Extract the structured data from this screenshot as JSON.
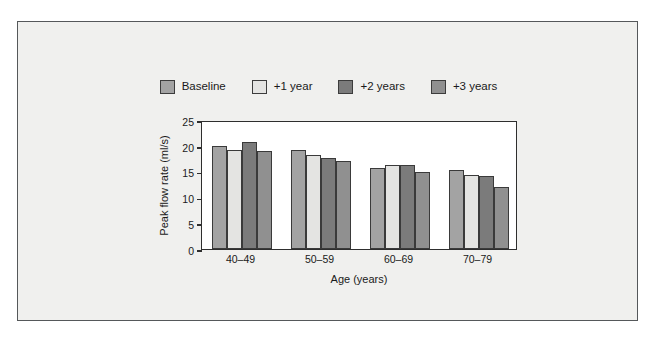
{
  "chart_data": {
    "type": "bar",
    "title": "",
    "xlabel": "Age (years)",
    "ylabel": "Peak flow rate (ml/s)",
    "categories": [
      "40–49",
      "50–59",
      "60–69",
      "70–79"
    ],
    "yticks": [
      0,
      5,
      10,
      15,
      20,
      25
    ],
    "ylim": [
      0,
      25
    ],
    "grid": false,
    "legend_position": "top-center",
    "series": [
      {
        "name": "Baseline",
        "color": "#a3a3a3",
        "values": [
          20.0,
          19.2,
          15.7,
          15.3
        ]
      },
      {
        "name": "+1 year",
        "color": "#e4e4e2",
        "values": [
          19.2,
          18.3,
          16.2,
          14.3
        ]
      },
      {
        "name": "+2 years",
        "color": "#7b7b7b",
        "values": [
          20.7,
          17.7,
          16.2,
          14.2
        ]
      },
      {
        "name": "+3 years",
        "color": "#909090",
        "values": [
          19.0,
          17.0,
          15.0,
          12.0
        ]
      }
    ]
  },
  "legend": {
    "items": [
      {
        "label": "Baseline",
        "color": "#a3a3a3"
      },
      {
        "label": "+1 year",
        "color": "#e4e4e2"
      },
      {
        "label": "+2 years",
        "color": "#7b7b7b"
      },
      {
        "label": "+3 years",
        "color": "#909090"
      }
    ]
  },
  "axes": {
    "y_title": "Peak flow rate (ml/s)",
    "x_title": "Age (years)",
    "y_tick_labels": [
      "0",
      "5",
      "10",
      "15",
      "20",
      "25"
    ],
    "x_tick_labels": [
      "40–49",
      "50–59",
      "60–69",
      "70–79"
    ]
  }
}
